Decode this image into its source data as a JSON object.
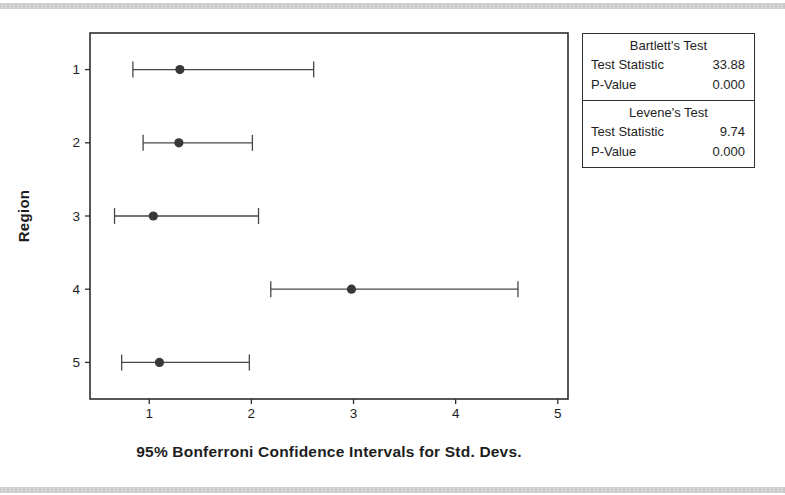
{
  "chart_data": {
    "type": "interval_plot",
    "title": "95% Bonferroni Confidence Intervals for Std. Devs.",
    "ylabel": "Region",
    "categories": [
      "1",
      "2",
      "3",
      "4",
      "5"
    ],
    "intervals": [
      {
        "region": "1",
        "lower": 0.84,
        "center": 1.3,
        "upper": 2.61
      },
      {
        "region": "2",
        "lower": 0.94,
        "center": 1.29,
        "upper": 2.01
      },
      {
        "region": "3",
        "lower": 0.66,
        "center": 1.04,
        "upper": 2.07
      },
      {
        "region": "4",
        "lower": 2.19,
        "center": 2.98,
        "upper": 4.61
      },
      {
        "region": "5",
        "lower": 0.73,
        "center": 1.1,
        "upper": 1.98
      }
    ],
    "x_ticks": [
      "1",
      "2",
      "3",
      "4",
      "5"
    ],
    "x_tick_values": [
      1,
      2,
      3,
      4,
      5
    ],
    "xlim": [
      0.42,
      5.1
    ],
    "grid": false,
    "legend": "none",
    "colors": {
      "interval_line": "#474747",
      "dot": "#383838",
      "frame": "#2e2e2e",
      "text": "#1e1e1e"
    }
  },
  "tests_panel": {
    "bartlett": {
      "title": "Bartlett's Test",
      "rows": [
        {
          "label": "Test Statistic",
          "value": "33.88"
        },
        {
          "label": "P-Value",
          "value": "0.000"
        }
      ]
    },
    "levene": {
      "title": "Levene's Test",
      "rows": [
        {
          "label": "Test Statistic",
          "value": "9.74"
        },
        {
          "label": "P-Value",
          "value": "0.000"
        }
      ]
    }
  }
}
